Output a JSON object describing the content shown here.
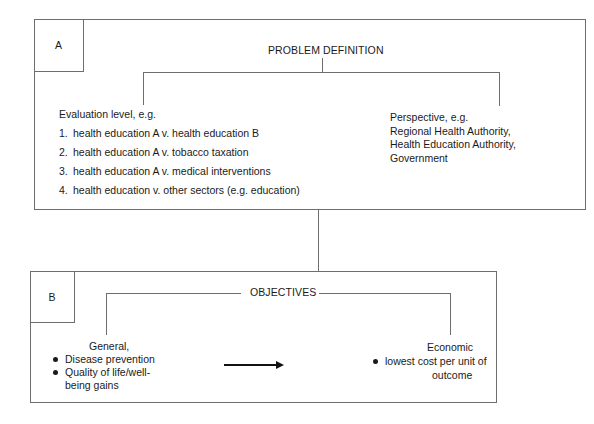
{
  "section_a": {
    "label": "A",
    "title": "PROBLEM DEFINITION",
    "evaluation": {
      "heading": "Evaluation level, e.g.",
      "items": [
        {
          "num": "1.",
          "text": "health education A v. health education B"
        },
        {
          "num": "2.",
          "text": "health education A v. tobacco taxation"
        },
        {
          "num": "3.",
          "text": "health education A v. medical interventions"
        },
        {
          "num": "4.",
          "text": "health education v. other sectors (e.g. education)"
        }
      ]
    },
    "perspective": {
      "heading": "Perspective, e.g.",
      "lines": [
        "Regional Health Authority,",
        "Health Education Authority,",
        "Government"
      ]
    }
  },
  "section_b": {
    "label": "B",
    "title": "OBJECTIVES",
    "general": {
      "heading": "General,",
      "bullets": [
        "Disease prevention",
        "Quality of life/well-",
        "being gains"
      ]
    },
    "economic": {
      "heading": "Economic",
      "bullets": [
        "lowest cost per unit of",
        "outcome"
      ]
    },
    "arrow_icon": "right-arrow"
  }
}
